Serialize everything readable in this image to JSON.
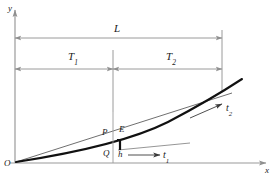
{
  "figure": {
    "axes": {
      "y_label": "y",
      "x_label": "x",
      "origin_label": "O"
    },
    "dimensions": [
      {
        "name": "L",
        "label": "L",
        "sub": "",
        "span_label": "L"
      },
      {
        "name": "T1",
        "label": "T",
        "sub": "1",
        "span_label": "T1"
      },
      {
        "name": "T2",
        "label": "T",
        "sub": "2",
        "span_label": "T2"
      }
    ],
    "points": [
      {
        "name": "P",
        "label": "P"
      },
      {
        "name": "E",
        "label": "E"
      },
      {
        "name": "Q",
        "label": "Q"
      },
      {
        "name": "h",
        "label": "h"
      }
    ],
    "tangents": [
      {
        "name": "t1",
        "label": "t",
        "sub": "1"
      },
      {
        "name": "t2",
        "label": "t",
        "sub": "2"
      }
    ],
    "colors": {
      "curve": "#111111",
      "axis": "#9a9a9a",
      "dimension": "#9a9a9a",
      "chord": "#6a6a6a",
      "background": "#ffffff",
      "text": "#1a1a1a"
    }
  }
}
